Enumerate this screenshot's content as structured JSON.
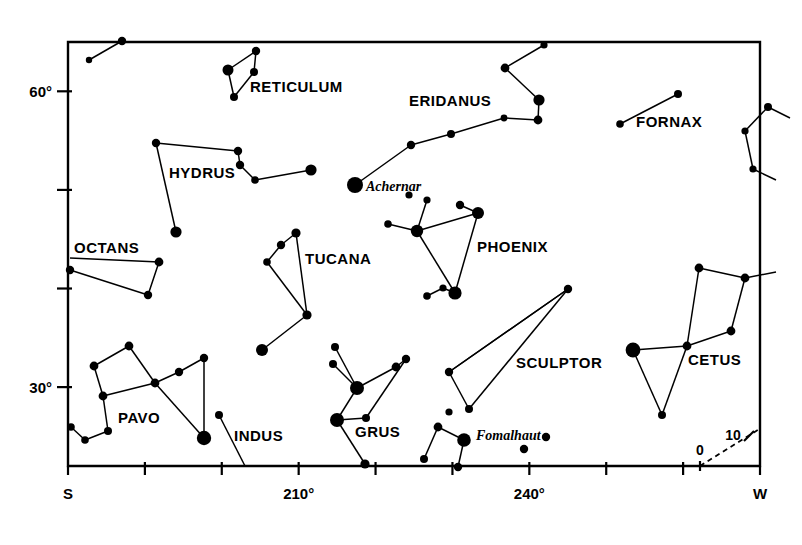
{
  "chart_data": {
    "type": "scatter",
    "xlabel": "Azimuth",
    "ylabel": "Altitude",
    "xlim": [
      180,
      270
    ],
    "ylim": [
      0,
      65
    ],
    "grid": false,
    "legend": "none",
    "x_axis": {
      "ticks": [
        {
          "x": 180,
          "label": "S"
        },
        {
          "x": 190,
          "label": ""
        },
        {
          "x": 200,
          "label": ""
        },
        {
          "x": 210,
          "label": "210°"
        },
        {
          "x": 220,
          "label": ""
        },
        {
          "x": 230,
          "label": ""
        },
        {
          "x": 240,
          "label": "240°"
        },
        {
          "x": 250,
          "label": ""
        },
        {
          "x": 260,
          "label": ""
        },
        {
          "x": 270,
          "label": "W"
        }
      ]
    },
    "y_axis": {
      "ticks": [
        {
          "y": 30,
          "label": "30°"
        },
        {
          "y": 40,
          "label": ""
        },
        {
          "y": 50,
          "label": ""
        },
        {
          "y": 60,
          "label": "60°"
        }
      ]
    },
    "annotations": [
      {
        "name": "ecliptic-zero-label",
        "label": "0",
        "x": 700,
        "y": 455
      },
      {
        "name": "ecliptic-ten-label",
        "label": "10",
        "x": 733,
        "y": 440
      }
    ],
    "constellations": [
      {
        "name": "RETICULUM",
        "label_x": 250,
        "label_y": 92,
        "stars": [
          {
            "x": 228,
            "y": 70,
            "r": 5.5
          },
          {
            "x": 256,
            "y": 51,
            "r": 4.2
          },
          {
            "x": 254,
            "y": 72,
            "r": 4.0
          },
          {
            "x": 234,
            "y": 97,
            "r": 4.0
          }
        ],
        "lines": [
          [
            0,
            1
          ],
          [
            1,
            2
          ],
          [
            2,
            3
          ],
          [
            0,
            3
          ]
        ]
      },
      {
        "name": "HYDRUS",
        "label_x": 169,
        "label_y": 178,
        "stars": [
          {
            "x": 156,
            "y": 143,
            "r": 4.2
          },
          {
            "x": 238,
            "y": 151,
            "r": 4.2
          },
          {
            "x": 240,
            "y": 165,
            "r": 4.2
          },
          {
            "x": 255,
            "y": 180,
            "r": 3.8
          },
          {
            "x": 311,
            "y": 170,
            "r": 5.6
          },
          {
            "x": 176,
            "y": 232,
            "r": 5.6
          }
        ],
        "lines": [
          [
            0,
            1
          ],
          [
            1,
            2
          ],
          [
            2,
            3
          ],
          [
            3,
            4
          ],
          [
            0,
            5
          ]
        ]
      },
      {
        "name": "ERIDANUS",
        "label_x": 409,
        "label_y": 106,
        "stars": [
          {
            "x": 544,
            "y": 45,
            "r": 3.6
          },
          {
            "x": 505,
            "y": 68,
            "r": 4.4
          },
          {
            "x": 539,
            "y": 100,
            "r": 5.6
          },
          {
            "x": 538,
            "y": 120,
            "r": 4.4
          },
          {
            "x": 504,
            "y": 118,
            "r": 3.4
          },
          {
            "x": 451,
            "y": 134,
            "r": 4.0
          },
          {
            "x": 411,
            "y": 145,
            "r": 4.2
          },
          {
            "x": 355,
            "y": 185,
            "r": 8.0
          }
        ],
        "lines": [
          [
            0,
            1
          ],
          [
            1,
            2
          ],
          [
            2,
            3
          ],
          [
            3,
            4
          ],
          [
            4,
            5
          ],
          [
            5,
            6
          ],
          [
            6,
            7
          ]
        ]
      },
      {
        "name": "FORNAX",
        "label_x": 636,
        "label_y": 127,
        "stars": [
          {
            "x": 678,
            "y": 94,
            "r": 4.0
          },
          {
            "x": 620,
            "y": 124,
            "r": 3.8
          }
        ],
        "lines": [
          [
            0,
            1
          ]
        ]
      },
      {
        "name": "OCTANS",
        "label_x": 74,
        "label_y": 253,
        "stars": [
          {
            "x": 159,
            "y": 262,
            "r": 4.4
          },
          {
            "x": 148,
            "y": 295,
            "r": 4.2
          },
          {
            "x": 70,
            "y": 270,
            "r": 4.2
          }
        ],
        "lines": [
          [
            0,
            1
          ],
          [
            1,
            2
          ]
        ]
      },
      {
        "name": "TUCANA",
        "label_x": 305,
        "label_y": 264,
        "stars": [
          {
            "x": 296,
            "y": 233,
            "r": 4.6
          },
          {
            "x": 281,
            "y": 245,
            "r": 4.2
          },
          {
            "x": 267,
            "y": 262,
            "r": 3.8
          },
          {
            "x": 307,
            "y": 315,
            "r": 4.6
          },
          {
            "x": 262,
            "y": 350,
            "r": 6.0
          }
        ],
        "lines": [
          [
            0,
            1
          ],
          [
            1,
            2
          ],
          [
            2,
            3
          ],
          [
            0,
            3
          ],
          [
            3,
            4
          ]
        ]
      },
      {
        "name": "PHOENIX",
        "label_x": 477,
        "label_y": 252,
        "stars": [
          {
            "x": 460,
            "y": 205,
            "r": 4.2
          },
          {
            "x": 478,
            "y": 213,
            "r": 6.0
          },
          {
            "x": 417,
            "y": 231,
            "r": 6.2
          },
          {
            "x": 427,
            "y": 200,
            "r": 3.6
          },
          {
            "x": 388,
            "y": 224,
            "r": 3.8
          },
          {
            "x": 455,
            "y": 293,
            "r": 6.6
          },
          {
            "x": 443,
            "y": 288,
            "r": 3.6
          },
          {
            "x": 427,
            "y": 296,
            "r": 3.8
          }
        ],
        "lines": [
          [
            0,
            1
          ],
          [
            1,
            2
          ],
          [
            2,
            3
          ],
          [
            2,
            4
          ],
          [
            1,
            5
          ],
          [
            2,
            5
          ],
          [
            5,
            6
          ],
          [
            6,
            7
          ]
        ]
      },
      {
        "name": "SCULPTOR",
        "label_x": 516,
        "label_y": 368,
        "stars": [
          {
            "x": 568,
            "y": 289,
            "r": 4.2
          },
          {
            "x": 449,
            "y": 372,
            "r": 4.2
          },
          {
            "x": 469,
            "y": 409,
            "r": 4.0
          }
        ],
        "lines": [
          [
            0,
            1
          ],
          [
            1,
            2
          ],
          [
            2,
            0
          ]
        ]
      },
      {
        "name": "CETUS",
        "label_x": 688,
        "label_y": 365,
        "stars": [
          {
            "x": 699,
            "y": 268,
            "r": 4.4
          },
          {
            "x": 745,
            "y": 278,
            "r": 4.4
          },
          {
            "x": 731,
            "y": 331,
            "r": 4.4
          },
          {
            "x": 687,
            "y": 346,
            "r": 4.4
          },
          {
            "x": 633,
            "y": 350,
            "r": 7.4
          },
          {
            "x": 662,
            "y": 415,
            "r": 4.0
          }
        ],
        "lines": [
          [
            0,
            1
          ],
          [
            1,
            2
          ],
          [
            2,
            3
          ],
          [
            3,
            0
          ],
          [
            3,
            4
          ],
          [
            4,
            5
          ],
          [
            5,
            3
          ]
        ]
      },
      {
        "name": "PAVO",
        "label_x": 118,
        "label_y": 423,
        "stars": [
          {
            "x": 129,
            "y": 346,
            "r": 4.4
          },
          {
            "x": 94,
            "y": 366,
            "r": 4.4
          },
          {
            "x": 103,
            "y": 396,
            "r": 4.4
          },
          {
            "x": 155,
            "y": 383,
            "r": 4.4
          },
          {
            "x": 179,
            "y": 372,
            "r": 4.2
          },
          {
            "x": 204,
            "y": 358,
            "r": 4.2
          },
          {
            "x": 204,
            "y": 438,
            "r": 7.2
          },
          {
            "x": 108,
            "y": 431,
            "r": 4.0
          },
          {
            "x": 85,
            "y": 440,
            "r": 3.8
          },
          {
            "x": 71,
            "y": 427,
            "r": 3.8
          }
        ],
        "lines": [
          [
            0,
            1
          ],
          [
            1,
            2
          ],
          [
            2,
            3
          ],
          [
            0,
            3
          ],
          [
            3,
            4
          ],
          [
            4,
            5
          ],
          [
            5,
            6
          ],
          [
            3,
            6
          ],
          [
            2,
            7
          ],
          [
            7,
            8
          ],
          [
            8,
            9
          ]
        ]
      },
      {
        "name": "INDUS",
        "label_x": 234,
        "label_y": 441,
        "stars": [
          {
            "x": 219,
            "y": 415,
            "r": 4.0
          }
        ],
        "lines": []
      },
      {
        "name": "GRUS",
        "label_x": 355,
        "label_y": 437,
        "stars": [
          {
            "x": 335,
            "y": 347,
            "r": 4.0
          },
          {
            "x": 333,
            "y": 364,
            "r": 4.0
          },
          {
            "x": 357,
            "y": 388,
            "r": 7.0
          },
          {
            "x": 396,
            "y": 367,
            "r": 4.4
          },
          {
            "x": 406,
            "y": 359,
            "r": 4.2
          },
          {
            "x": 366,
            "y": 418,
            "r": 4.0
          },
          {
            "x": 337,
            "y": 420,
            "r": 7.0
          },
          {
            "x": 365,
            "y": 464,
            "r": 4.6
          }
        ],
        "lines": [
          [
            0,
            2
          ],
          [
            1,
            2
          ],
          [
            2,
            3
          ],
          [
            3,
            4
          ],
          [
            4,
            5
          ],
          [
            5,
            6
          ],
          [
            2,
            6
          ],
          [
            6,
            7
          ]
        ]
      },
      {
        "name": "PISCIS AUSTRINUS",
        "label_x": 0,
        "label_y": 0,
        "stars": [
          {
            "x": 464,
            "y": 440,
            "r": 6.8
          },
          {
            "x": 438,
            "y": 427,
            "r": 4.4
          },
          {
            "x": 424,
            "y": 459,
            "r": 4.0
          },
          {
            "x": 458,
            "y": 467,
            "r": 4.2
          },
          {
            "x": 524,
            "y": 449,
            "r": 4.2
          },
          {
            "x": 546,
            "y": 437,
            "r": 4.2
          },
          {
            "x": 449,
            "y": 412,
            "r": 3.6
          }
        ],
        "lines": [
          [
            0,
            1
          ],
          [
            1,
            2
          ],
          [
            0,
            3
          ]
        ]
      }
    ],
    "named_stars": [
      {
        "name": "Achernar",
        "label": "Achernar",
        "x": 355,
        "y": 185,
        "label_x": 366,
        "label_y": 191
      },
      {
        "name": "Fomalhaut",
        "label": "Fomalhaut",
        "x": 464,
        "y": 440,
        "label_x": 476,
        "label_y": 440
      }
    ],
    "extra_stars": [
      {
        "x": 122,
        "y": 41,
        "r": 4.2
      },
      {
        "x": 89,
        "y": 60,
        "r": 3.2
      },
      {
        "x": 768,
        "y": 107,
        "r": 4.0
      },
      {
        "x": 745,
        "y": 131,
        "r": 3.6
      },
      {
        "x": 753,
        "y": 169,
        "r": 3.6
      },
      {
        "x": 409,
        "y": 195,
        "r": 3.6
      }
    ],
    "border_lines": [
      {
        "x1": 768,
        "y1": 107,
        "x2": 790,
        "y2": 118
      },
      {
        "x1": 745,
        "y1": 131,
        "x2": 768,
        "y2": 107
      },
      {
        "x1": 745,
        "y1": 131,
        "x2": 753,
        "y2": 169
      },
      {
        "x1": 753,
        "y1": 169,
        "x2": 776,
        "y2": 180
      },
      {
        "x1": 745,
        "y1": 278,
        "x2": 776,
        "y2": 272
      }
    ],
    "ecliptic": {
      "x1": 700,
      "y1": 466,
      "x2": 761,
      "y2": 428,
      "tick_x": 749,
      "tick_y": 436
    }
  },
  "axis_text": {
    "y_60": "60°",
    "y_30": "30°",
    "x_s": "S",
    "x_210": "210°",
    "x_240": "240°",
    "x_w": "W",
    "ecliptic_0": "0",
    "ecliptic_10": "10"
  },
  "labels": {
    "reticulum": "RETICULUM",
    "hydrus": "HYDRUS",
    "eridanus": "ERIDANUS",
    "fornax": "FORNAX",
    "octans": "OCTANS",
    "tucana": "TUCANA",
    "phoenix": "PHOENIX",
    "sculptor": "SCULPTOR",
    "cetus": "CETUS",
    "pavo": "PAVO",
    "indus": "INDUS",
    "grus": "GRUS",
    "achernar": "Achernar",
    "fomalhaut": "Fomalhaut"
  }
}
